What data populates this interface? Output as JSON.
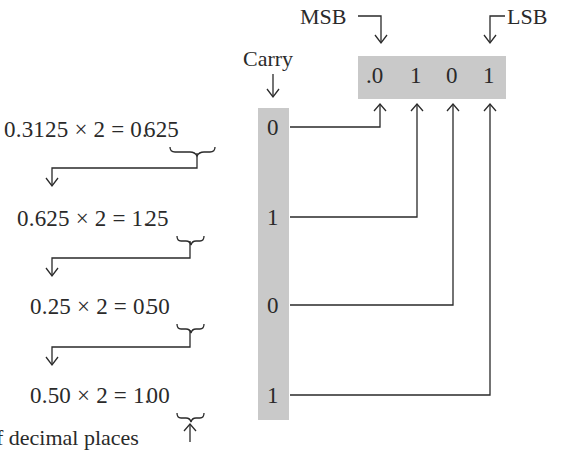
{
  "labels": {
    "msb": "MSB",
    "lsb": "LSB",
    "carry": "Carry",
    "footnote": "f decimal places"
  },
  "result": {
    "digits": [
      ".0",
      "1",
      "0",
      "1"
    ]
  },
  "steps": [
    {
      "multiplicand": "0.3125",
      "op": "×",
      "multiplier": "2",
      "eq": "=",
      "int_part": "0.",
      "frac_part": "625",
      "carry": "0"
    },
    {
      "multiplicand": "0.625",
      "op": "×",
      "multiplier": "2",
      "eq": "=",
      "int_part": "1.",
      "frac_part": "25",
      "carry": "1"
    },
    {
      "multiplicand": "0.25",
      "op": "×",
      "multiplier": "2",
      "eq": "=",
      "int_part": "0.",
      "frac_part": "50",
      "carry": "0"
    },
    {
      "multiplicand": "0.50",
      "op": "×",
      "multiplier": "2",
      "eq": "=",
      "int_part": "1.",
      "frac_part": "00",
      "carry": "1"
    }
  ],
  "colors": {
    "shade": "#c9c9c9",
    "ink": "#2a2a2a"
  }
}
